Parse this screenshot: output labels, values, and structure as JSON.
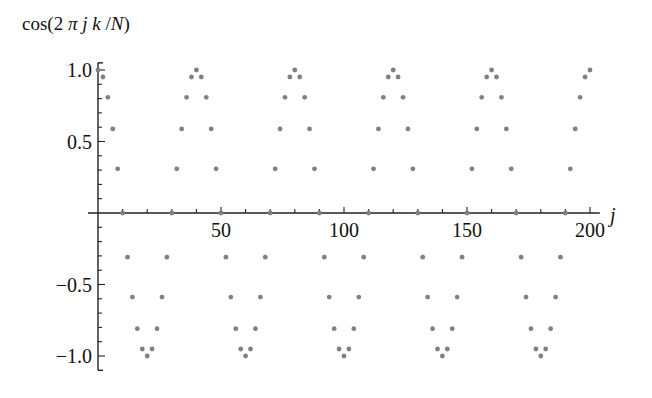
{
  "chart_data": {
    "type": "scatter",
    "title": "",
    "ylabel": "cos(2 π j k / N)",
    "xlabel": "j",
    "function": "cos(2*pi*j*k/N)",
    "params": {
      "k": 5,
      "N": 200
    },
    "x_range": [
      0,
      200
    ],
    "x_step": 2,
    "xlim": [
      0,
      204
    ],
    "ylim": [
      -1.1,
      1.05
    ],
    "x_ticks": [
      50,
      100,
      150,
      200
    ],
    "x_tick_labels": [
      "50",
      "100",
      "150",
      "200"
    ],
    "x_minor_step": 10,
    "y_ticks": [
      -1.0,
      -0.5,
      0.5,
      1.0
    ],
    "y_tick_labels": [
      "−1.0",
      "−0.5",
      "0.5",
      "1.0"
    ],
    "y_minor_step": 0.1,
    "grid": false,
    "legend": null,
    "marker_color": "#808080",
    "axis_color": "#222222"
  }
}
